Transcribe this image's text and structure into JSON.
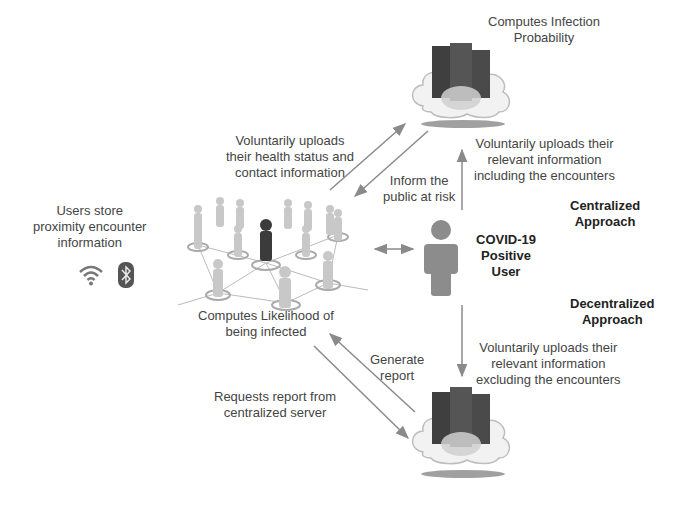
{
  "diagram": {
    "nodes": {
      "top_server": {
        "label_lines": [
          "Computes Infection",
          "Probability"
        ],
        "icon": "cloud-server-icon"
      },
      "bottom_server": {
        "icon": "cloud-server-icon"
      },
      "users_network": {
        "label_lines": [
          "Computes Likelihood of",
          "being infected"
        ],
        "icon": "people-network-icon"
      },
      "users_store": {
        "label_lines": [
          "Users store",
          "proximity encounter",
          "information"
        ],
        "icons": [
          "wifi-icon",
          "bluetooth-icon"
        ]
      },
      "covid_user": {
        "label_lines": [
          "COVID-19",
          "Positive",
          "User"
        ],
        "icon": "person-icon"
      }
    },
    "approaches": {
      "centralized": [
        "Centralized",
        "Approach"
      ],
      "decentralized": [
        "Decentralized",
        "Approach"
      ]
    },
    "edges": {
      "upload_health": [
        "Voluntarily uploads",
        "their health status and",
        "contact information"
      ],
      "inform_public": [
        "Inform the",
        "public at risk"
      ],
      "upload_including": [
        "Voluntarily uploads their",
        "relevant information",
        "including the encounters"
      ],
      "upload_excluding": [
        "Voluntarily uploads their",
        "relevant information",
        "excluding the encounters"
      ],
      "generate_report": [
        "Generate",
        "report"
      ],
      "request_report": [
        "Requests report from",
        "centralized server"
      ]
    },
    "colors": {
      "arrow": "#8a8a8a",
      "person": "#8c8c8c",
      "server": "#4a4a4a",
      "cloud": "#f2f2f2",
      "highlight_user": "#3b3b3b"
    }
  }
}
